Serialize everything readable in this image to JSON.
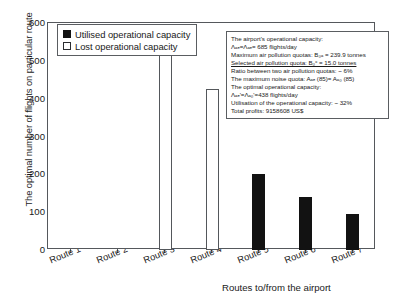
{
  "chart_data": {
    "type": "bar",
    "title": "",
    "xlabel": "Routes to/from the airport",
    "ylabel": "The optimal number of flights on particular route",
    "ylim": [
      0,
      600
    ],
    "yticks": [
      0,
      100,
      200,
      300,
      400,
      500,
      600
    ],
    "grid": false,
    "legend_position": "top-left",
    "categories": [
      "Route 1",
      "Route 2",
      "Route 3",
      "Route 4",
      "Route 5",
      "Route 6",
      "Route 7"
    ],
    "series": [
      {
        "name": "Utilised operational capacity",
        "color": "#121212",
        "values": [
          0,
          0,
          0,
          0,
          200,
          140,
          95
        ]
      },
      {
        "name": "Lost operational capacity",
        "color": "#ffffff",
        "values": [
          0,
          0,
          530,
          425,
          0,
          0,
          0
        ]
      }
    ]
  },
  "legend": {
    "items": [
      {
        "label": "Utilised operational capacity",
        "swatch": "filled"
      },
      {
        "label": "Lost operational capacity",
        "swatch": "hollow"
      }
    ]
  },
  "annotation": {
    "lines": [
      {
        "text": "The airport's operational capacity:",
        "underline": false
      },
      {
        "text": "Λₐₑ=Λₐₑ= 685 flights/day",
        "underline": false
      },
      {
        "text": "Maximum air pollution quotas: B₀ₐ = 239.9 tonnes",
        "underline": false
      },
      {
        "text": "Selected air pollution quota: B₀ᶜ = 15.0 tonnes",
        "underline": true
      },
      {
        "text": "Ratio between two air pollution quotas: ~ 6%",
        "underline": false
      },
      {
        "text": "The maximum noise quota: Aₐₑ (85)= Aₐ₀ (85)",
        "underline": false
      },
      {
        "text": "The optimal operational capacity:",
        "underline": false
      },
      {
        "text": "Λₐₑ'=Λₐ₀'=438 flights/day",
        "underline": false
      },
      {
        "text": "Utilisation of the operational capacity: ~ 32%",
        "underline": false
      },
      {
        "text": "Total profits: 9158608 US$",
        "underline": false
      }
    ]
  }
}
